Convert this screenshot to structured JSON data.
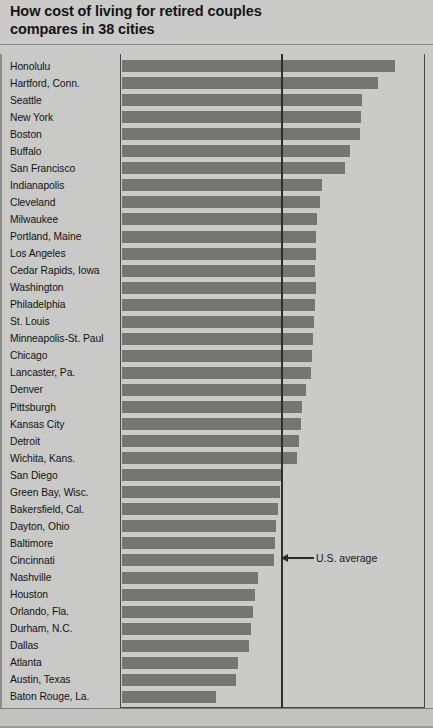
{
  "title": "How cost of living for retired couples\ncompares in 38 cities",
  "annotation": {
    "label": "U.S. average",
    "icon": "left-arrow-icon"
  },
  "colors": {
    "background": "#c9c9c7",
    "bar": "#757573",
    "frame": "#4a4a4a",
    "average_line": "#2f2f2f",
    "text": "#131313"
  },
  "chart_data": {
    "type": "bar",
    "orientation": "horizontal",
    "title": "How cost of living for retired couples compares in 38 cities",
    "xlabel": "",
    "ylabel": "",
    "grid": false,
    "legend": false,
    "annotations": [
      {
        "text": "U.S. average",
        "type": "reference-line",
        "axis": "x",
        "value": 100
      }
    ],
    "value_unit": "index (U.S. average = 100)",
    "xlim": [
      0,
      140
    ],
    "reference_value": 100,
    "categories": [
      "Honolulu",
      "Hartford, Conn.",
      "Seattle",
      "New York",
      "Boston",
      "Buffalo",
      "San Francisco",
      "Indianapolis",
      "Cleveland",
      "Milwaukee",
      "Portland, Maine",
      "Los Angeles",
      "Cedar Rapids, Iowa",
      "Washington",
      "Philadelphia",
      "St. Louis",
      "Minneapolis-St. Paul",
      "Chicago",
      "Lancaster, Pa.",
      "Denver",
      "Pittsburgh",
      "Kansas City",
      "Detroit",
      "Wichita, Kans.",
      "San Diego",
      "Green Bay, Wisc.",
      "Bakersfield, Cal.",
      "Dayton, Ohio",
      "Baltimore",
      "Cincinnati",
      "Nashville",
      "Houston",
      "Orlando, Fla.",
      "Durham, N.C.",
      "Dallas",
      "Atlanta",
      "Austin, Texas",
      "Baton Rouge, La."
    ],
    "values": [
      123.2,
      118.1,
      113.8,
      113.8,
      113.4,
      110.5,
      109.3,
      102.5,
      101.9,
      101.0,
      100.9,
      100.7,
      100.6,
      101.5,
      100.4,
      100.2,
      100.0,
      99.6,
      99.3,
      97.8,
      96.7,
      96.3,
      95.8,
      95.1,
      91.0,
      90.1,
      89.4,
      88.8,
      88.5,
      88.2,
      83.4,
      82.5,
      81.9,
      81.3,
      80.6,
      77.4,
      76.7,
      70.8
    ],
    "bar_pixel_ends": [
      395,
      378,
      362,
      361,
      360,
      350,
      345,
      322,
      320,
      317,
      316,
      316,
      315,
      316,
      315,
      314,
      313,
      312,
      311,
      306,
      302,
      301,
      299,
      297,
      283,
      280,
      278,
      276,
      275,
      274,
      258,
      255,
      253,
      251,
      249,
      238,
      236,
      216
    ]
  }
}
